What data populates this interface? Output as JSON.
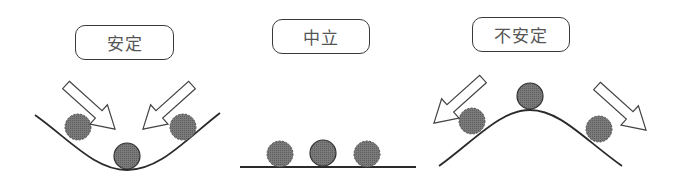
{
  "panels": [
    {
      "id": "stable",
      "label": "安定",
      "curve": "valley",
      "arrows": "inward"
    },
    {
      "id": "neutral",
      "label": "中立",
      "curve": "flat",
      "arrows": "none"
    },
    {
      "id": "unstable",
      "label": "不安定",
      "curve": "hill",
      "arrows": "outward"
    }
  ],
  "colors": {
    "ball_fill": "#6e6e6e",
    "line": "#2a2a2a",
    "arrow_fill": "#ffffff"
  }
}
